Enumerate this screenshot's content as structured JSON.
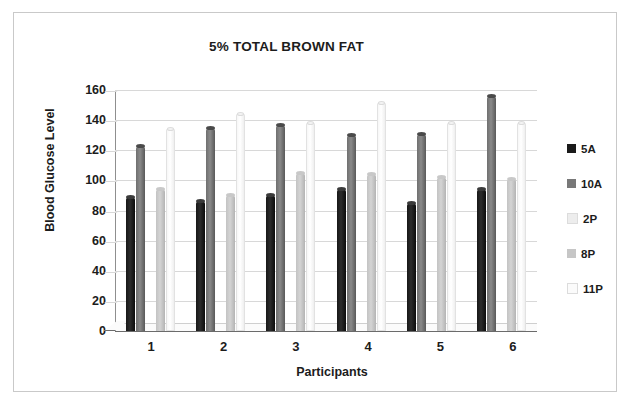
{
  "chart_data": {
    "type": "bar",
    "title": "5% TOTAL BROWN FAT",
    "xlabel": "Participants",
    "ylabel": "Blood Glucose Level",
    "categories": [
      "1",
      "2",
      "3",
      "4",
      "5",
      "6"
    ],
    "ylim": [
      0,
      160
    ],
    "yticks": [
      160,
      140,
      120,
      100,
      80,
      60,
      40,
      20,
      0
    ],
    "grid": true,
    "legend_position": "right",
    "series": [
      {
        "name": "5A",
        "color": "#1a1a1a",
        "values": [
          89,
          86,
          90,
          94,
          85,
          94
        ]
      },
      {
        "name": "10A",
        "color": "#787878",
        "values": [
          123,
          135,
          137,
          130,
          131,
          156
        ]
      },
      {
        "name": "2P",
        "color": "#ededed",
        "values": [
          0,
          0,
          0,
          0,
          0,
          0
        ]
      },
      {
        "name": "8P",
        "color": "#c6c6c6",
        "values": [
          94,
          90,
          105,
          104,
          102,
          101
        ]
      },
      {
        "name": "11P",
        "color": "#fbfbfb",
        "values": [
          135,
          145,
          139,
          152,
          139,
          139
        ]
      }
    ]
  }
}
